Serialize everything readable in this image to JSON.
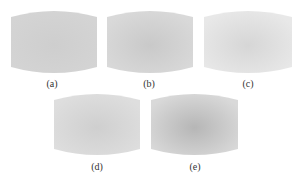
{
  "figure": {
    "panels": [
      {
        "id": "a",
        "label": "(a)",
        "x": 11,
        "y": 11,
        "w": 86,
        "h": 62,
        "label_x": 52,
        "label_y": 78,
        "center_color": "#cecece",
        "edge_color": "#d4d4d4"
      },
      {
        "id": "b",
        "label": "(b)",
        "x": 107,
        "y": 11,
        "w": 86,
        "h": 62,
        "label_x": 149,
        "label_y": 78,
        "center_color": "#c9c9c9",
        "edge_color": "#d9d9d9"
      },
      {
        "id": "c",
        "label": "(c)",
        "x": 204,
        "y": 11,
        "w": 88,
        "h": 62,
        "label_x": 248,
        "label_y": 78,
        "center_color": "#d6d6d6",
        "edge_color": "#e8e8e8"
      },
      {
        "id": "d",
        "label": "(d)",
        "x": 54,
        "y": 94,
        "w": 86,
        "h": 61,
        "label_x": 97,
        "label_y": 161,
        "center_color": "#cfcfcf",
        "edge_color": "#dedede"
      },
      {
        "id": "e",
        "label": "(e)",
        "x": 151,
        "y": 94,
        "w": 87,
        "h": 61,
        "label_x": 195,
        "label_y": 161,
        "center_color": "#b6b6b6",
        "edge_color": "#d9d9d9"
      }
    ]
  }
}
